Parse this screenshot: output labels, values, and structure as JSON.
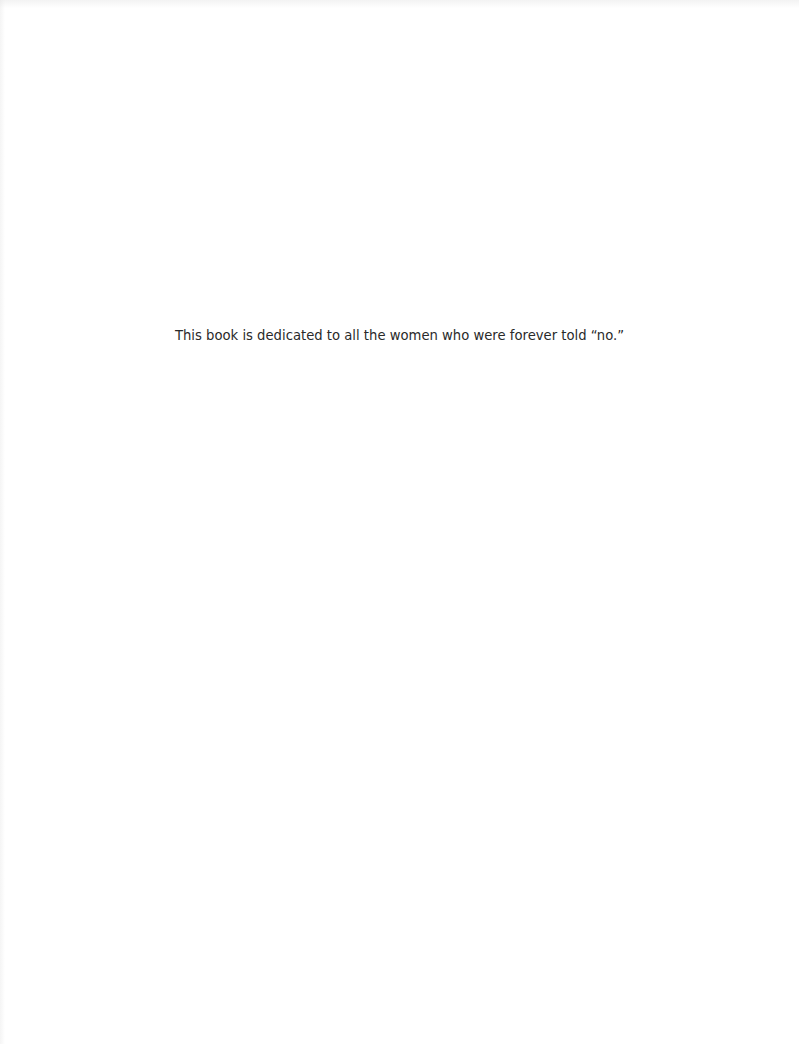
{
  "page": {
    "type": "dedication",
    "text": "This book is dedicated to all the women who were forever told “no.”",
    "background_color": "#ffffff",
    "text_color": "#2a2a2a"
  }
}
